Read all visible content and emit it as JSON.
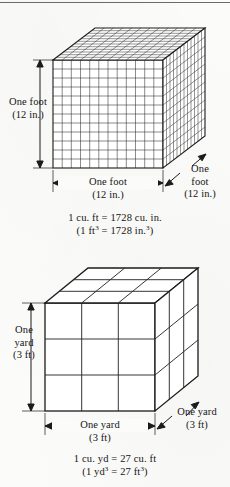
{
  "document": {
    "type": "textbook-figure",
    "subject": "volume-unit-conversion",
    "background_color": "#fbfbf9",
    "ink_color": "#151515"
  },
  "figures": [
    {
      "id": "cubic-foot",
      "solid": "cube",
      "divisions_per_edge": 12,
      "labels": {
        "left_line1": "One foot",
        "left_line2": "(12 in.)",
        "bottom_line1": "One foot",
        "bottom_line2": "(12 in.)",
        "right_line1": "One",
        "right_line2": "foot",
        "right_line3": "(12 in.)"
      },
      "caption": {
        "line1": "1 cu. ft = 1728 cu. in.",
        "line2_prefix": "(1 ft",
        "line2_exp1": "3",
        "line2_middle": " = 1728 in.",
        "line2_exp2": "3",
        "line2_suffix": ")"
      }
    },
    {
      "id": "cubic-yard",
      "solid": "cube",
      "divisions_per_edge": 3,
      "labels": {
        "left_line1": "One",
        "left_line2": "yard",
        "left_line3": "(3 ft)",
        "bottom_line1": "One yard",
        "bottom_line2": "(3 ft)",
        "right_line1": "One yard",
        "right_line2": "(3 ft)"
      },
      "caption": {
        "line1": "1 cu. yd = 27 cu. ft",
        "line2_prefix": "(1 yd",
        "line2_exp1": "3",
        "line2_middle": " = 27 ft",
        "line2_exp2": "3",
        "line2_suffix": ")"
      }
    }
  ]
}
